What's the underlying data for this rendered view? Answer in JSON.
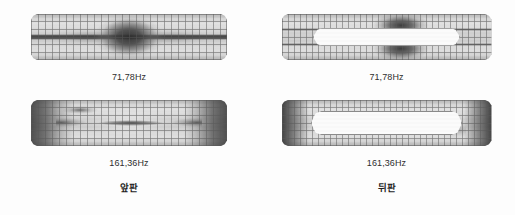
{
  "figure": {
    "background_color": "#fdfdfd",
    "mesh_color": "#5a5a5a",
    "cutout_color": "#fbfbfb"
  },
  "columns": [
    {
      "id": "front",
      "caption": "앞판",
      "has_cutout": false,
      "modes": [
        {
          "id": "front-mode1",
          "frequency_label": "71,78Hz",
          "mode_index": 1
        },
        {
          "id": "front-mode2",
          "frequency_label": "161,36Hz",
          "mode_index": 2
        }
      ]
    },
    {
      "id": "back",
      "caption": "뒤판",
      "has_cutout": true,
      "modes": [
        {
          "id": "back-mode1",
          "frequency_label": "71,78Hz",
          "mode_index": 1
        },
        {
          "id": "back-mode2",
          "frequency_label": "161,36Hz",
          "mode_index": 2
        }
      ]
    }
  ]
}
